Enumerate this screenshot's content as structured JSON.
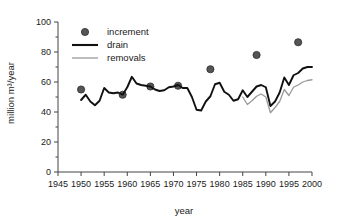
{
  "chart_data": {
    "type": "line",
    "title": "",
    "xlabel": "year",
    "ylabel": "million m³/year",
    "xlim": [
      1945,
      2000
    ],
    "ylim": [
      0,
      100
    ],
    "xticks": [
      1945,
      1950,
      1955,
      1960,
      1965,
      1970,
      1975,
      1980,
      1985,
      1990,
      1995,
      2000
    ],
    "xtick_labels": [
      "1945",
      "1950",
      "1955",
      "1960",
      "1965",
      "1970",
      "1975",
      "1980",
      "1985",
      "1990",
      "1995",
      "2000"
    ],
    "yticks": [
      0,
      20,
      40,
      60,
      80,
      100
    ],
    "ytick_labels": [
      "0",
      "20",
      "40",
      "60",
      "80",
      "100"
    ],
    "minor_yticks": [
      10,
      30,
      50,
      70,
      90
    ],
    "grid": false,
    "legend_position": "top-left-inside",
    "colors": {
      "drain": "#111111",
      "removals": "#999999",
      "increment": "#555555",
      "axis": "#444444",
      "background": "#ffffff"
    },
    "series": [
      {
        "name": "increment",
        "type": "scatter",
        "marker": "filled-circle",
        "color": "#555555",
        "points": [
          {
            "x": 1950,
            "y": 55
          },
          {
            "x": 1959,
            "y": 51.5
          },
          {
            "x": 1965,
            "y": 57
          },
          {
            "x": 1971,
            "y": 57.5
          },
          {
            "x": 1978,
            "y": 68.5
          },
          {
            "x": 1988,
            "y": 78
          },
          {
            "x": 1997,
            "y": 86.5
          }
        ]
      },
      {
        "name": "drain",
        "type": "line",
        "color": "#111111",
        "linewidth": 1.9,
        "x": [
          1950,
          1951,
          1952,
          1953,
          1954,
          1955,
          1956,
          1957,
          1958,
          1959,
          1960,
          1961,
          1962,
          1963,
          1964,
          1965,
          1966,
          1967,
          1968,
          1969,
          1970,
          1971,
          1972,
          1973,
          1974,
          1975,
          1976,
          1977,
          1978,
          1979,
          1980,
          1981,
          1982,
          1983,
          1984,
          1985,
          1986,
          1987,
          1988,
          1989,
          1990,
          1991,
          1992,
          1993,
          1994,
          1995,
          1996,
          1997,
          1998,
          1999,
          2000
        ],
        "y": [
          48,
          51.5,
          47,
          44.5,
          47.5,
          56,
          53,
          52.5,
          53,
          51.5,
          56.5,
          63.5,
          59,
          58,
          57.5,
          57,
          55,
          54,
          54.5,
          56.5,
          57,
          58,
          56,
          56,
          50,
          41.5,
          41,
          47,
          50.5,
          58.5,
          59.5,
          53.5,
          51.5,
          47.5,
          48.5,
          54.5,
          50,
          53.5,
          57,
          58,
          56.5,
          44,
          47,
          53,
          63,
          58,
          64.5,
          66,
          69,
          70,
          70
        ]
      },
      {
        "name": "removals",
        "type": "line",
        "color": "#999999",
        "linewidth": 1.3,
        "x": [
          1985,
          1986,
          1987,
          1988,
          1989,
          1990,
          1991,
          1992,
          1993,
          1994,
          1995,
          1996,
          1997,
          1998,
          1999,
          2000
        ],
        "y": [
          50,
          45,
          47.5,
          50.5,
          52,
          50,
          39.5,
          43,
          47,
          55,
          51,
          56.5,
          58,
          60,
          61,
          61.5
        ]
      }
    ]
  },
  "legend": {
    "items": [
      {
        "label": "increment",
        "marker": "dot",
        "color": "#555555"
      },
      {
        "label": "drain",
        "marker": "thick-line",
        "color": "#111111"
      },
      {
        "label": "removals",
        "marker": "thin-line",
        "color": "#999999"
      }
    ]
  }
}
